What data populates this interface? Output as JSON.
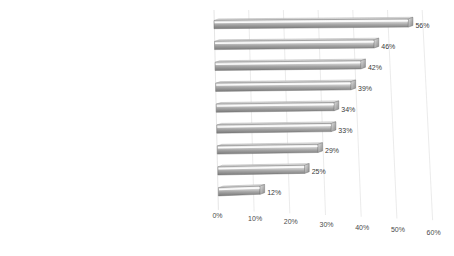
{
  "chart_data": {
    "type": "bar",
    "orientation": "horizontal",
    "style": "3d-perspective",
    "title": "",
    "subtitle": "",
    "xlabel": "",
    "ylabel": "",
    "categories": [
      "uniquely products",
      "guarantees that I feel uniquely",
      "are great for a gift that reflects the recipient's expectations",
      "guarantee higher product quality",
      "influence on the product",
      "guarantee greater comfort of using",
      "better reflects my personality",
      "guarantee they increase their value in the future",
      "the best for collecting"
    ],
    "values": [
      56,
      46,
      42,
      39,
      34,
      33,
      29,
      25,
      12
    ],
    "value_labels": [
      "56%",
      "46%",
      "42%",
      "39%",
      "34%",
      "33%",
      "29%",
      "25%",
      "12%"
    ],
    "xlim": [
      0,
      60
    ],
    "xticks": [
      0,
      10,
      20,
      30,
      40,
      50,
      60
    ],
    "xtick_labels": [
      "0%",
      "10%",
      "20%",
      "30%",
      "40%",
      "50%",
      "60%"
    ],
    "grid": true,
    "grid_axis": "x",
    "legend": false,
    "legend_position": "none",
    "colors": {
      "background": "#ffffff",
      "bar_top": "#d9d9d9",
      "bar_highlight": "#f2f2f2",
      "bar_mid": "#b0b0b0",
      "bar_bottom": "#7f7f7f",
      "bar_edge": "#6e6e6e",
      "gridline": "#e2e2e2",
      "text": "#2b2b2b"
    }
  }
}
